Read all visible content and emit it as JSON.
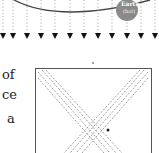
{
  "figure_top": {
    "earth_label": "Earth",
    "earth_sublabel": "(hot)",
    "ray_count": 11,
    "colors": {
      "orbit": "#444444",
      "earth": "#8a8a8a",
      "arrow": "#111111",
      "ray": "#888888"
    }
  },
  "body_text": {
    "line1": "of",
    "line2": "ce",
    "line3": "a"
  },
  "figure_bottom": {
    "marker": "."
  }
}
